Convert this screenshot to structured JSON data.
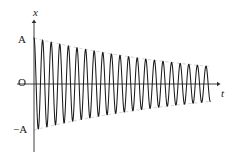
{
  "figure": {
    "background_color": "#ffffff",
    "curve_color": "#1a1a1a",
    "axis_color": "#2b2b2b",
    "envelope_color": "#b5b5b5"
  },
  "labels": {
    "y_axis": "x",
    "x_axis": "t",
    "origin": "O",
    "amplitude_positive": "A",
    "amplitude_negative": "−A"
  },
  "chart_data": {
    "type": "line",
    "xlabel": "t",
    "ylabel": "x",
    "grid": false,
    "legend": null,
    "xlim": [
      0,
      21
    ],
    "ylim": [
      -1.15,
      1.15
    ],
    "axis_ticks": {
      "y_tick_labels": [
        "A",
        "O",
        "−A"
      ],
      "y_tick_values": [
        1,
        0,
        -1
      ],
      "x_tick_labels": [],
      "x_tick_values": []
    },
    "annotations": [
      {
        "text": "x",
        "role": "y-axis-name",
        "position": "top of vertical axis"
      },
      {
        "text": "t",
        "role": "x-axis-name",
        "position": "right of horizontal axis"
      },
      {
        "text": "O",
        "role": "origin-label",
        "position": "left of origin"
      },
      {
        "text": "A",
        "role": "positive-amplitude-tick",
        "position": "left of axis at y = A"
      },
      {
        "text": "−A",
        "role": "negative-amplitude-tick",
        "position": "left of axis at y = −A"
      }
    ],
    "model": {
      "equation": "x(t) = A e^(-bt) cos(2π t / T)",
      "initial_amplitude_A": 1.0,
      "period_T": 1.0,
      "decay_constant_b": 0.0455,
      "num_cycles_drawn": 20.5,
      "final_amplitude_fraction": 0.38
    },
    "series": [
      {
        "name": "damped oscillation",
        "style": "solid",
        "color": "#1a1a1a",
        "points_description": "20.5 cycles of a cosine starting at +A, amplitude decaying exponentially to about 0.38A"
      },
      {
        "name": "upper envelope",
        "style": "dashed",
        "color": "#b5b5b5",
        "equation": "+A e^(-bt)"
      },
      {
        "name": "lower envelope",
        "style": "dashed",
        "color": "#b5b5b5",
        "equation": "-A e^(-bt)"
      }
    ],
    "peaks": {
      "x": [
        0,
        1,
        2,
        3,
        4,
        5,
        6,
        7,
        8,
        9,
        10,
        11,
        12,
        13,
        14,
        15,
        16,
        17,
        18,
        19,
        20
      ],
      "y": [
        1.0,
        0.955,
        0.912,
        0.871,
        0.832,
        0.795,
        0.759,
        0.725,
        0.692,
        0.661,
        0.632,
        0.603,
        0.576,
        0.55,
        0.526,
        0.502,
        0.479,
        0.458,
        0.437,
        0.418,
        0.399
      ]
    },
    "troughs": {
      "x": [
        0.5,
        1.5,
        2.5,
        3.5,
        4.5,
        5.5,
        6.5,
        7.5,
        8.5,
        9.5,
        10.5,
        11.5,
        12.5,
        13.5,
        14.5,
        15.5,
        16.5,
        17.5,
        18.5,
        19.5
      ],
      "y": [
        -0.977,
        -0.933,
        -0.891,
        -0.851,
        -0.813,
        -0.777,
        -0.742,
        -0.708,
        -0.676,
        -0.646,
        -0.617,
        -0.589,
        -0.563,
        -0.538,
        -0.514,
        -0.49,
        -0.468,
        -0.447,
        -0.427,
        -0.408
      ]
    }
  },
  "geometry": {
    "origin_px": {
      "x": 34,
      "y": 84
    },
    "y_axis_top_px": 18,
    "y_axis_bottom_px": 152,
    "x_axis_right_px": 222,
    "amplitude_px": 46,
    "period_px": 8.6,
    "cycles": 20.5
  }
}
